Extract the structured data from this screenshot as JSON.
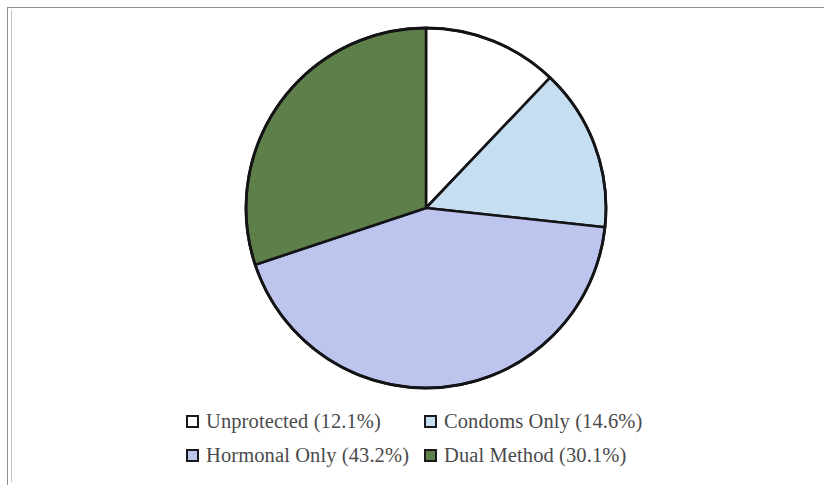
{
  "figure": {
    "background_color": "#ffffff",
    "frame_color": "#8d8f92"
  },
  "chart_data": {
    "type": "pie",
    "title": "",
    "subtitle": "",
    "xlabel": "",
    "ylabel": "",
    "grid": false,
    "legend_position": "bottom",
    "start_angle_deg": 0,
    "direction": "clockwise",
    "categories": [
      "Unprotected",
      "Condoms Only",
      "Hormonal Only",
      "Dual Method"
    ],
    "values": [
      12.1,
      14.6,
      43.2,
      30.1
    ],
    "value_unit": "%",
    "total": 100.0,
    "colors": [
      "#ffffff",
      "#c6def2",
      "#bdc4ee",
      "#5f7f4a"
    ],
    "edge_color": "#141416",
    "slices": [
      {
        "label": "Unprotected",
        "value": 12.1,
        "display": "Unprotected (12.1%)",
        "color": "#ffffff",
        "start_deg": 0.0,
        "end_deg": 43.56
      },
      {
        "label": "Condoms Only",
        "value": 14.6,
        "display": "Condoms Only (14.6%)",
        "color": "#c6def2",
        "start_deg": 43.56,
        "end_deg": 96.12
      },
      {
        "label": "Hormonal Only",
        "value": 43.2,
        "display": "Hormonal Only (43.2%)",
        "color": "#bdc4ee",
        "start_deg": 96.12,
        "end_deg": 251.64
      },
      {
        "label": "Dual Method",
        "value": 30.1,
        "display": "Dual Method (30.1%)",
        "color": "#5f7f4a",
        "start_deg": 251.64,
        "end_deg": 360.0
      }
    ]
  },
  "legend": {
    "rows": [
      [
        {
          "display": "Unprotected (12.1%)",
          "color": "#ffffff"
        },
        {
          "display": "Condoms Only (14.6%)",
          "color": "#c6def2"
        }
      ],
      [
        {
          "display": "Hormonal Only (43.2%)",
          "color": "#bdc4ee"
        },
        {
          "display": "Dual Method (30.1%)",
          "color": "#5f7f4a"
        }
      ]
    ]
  }
}
